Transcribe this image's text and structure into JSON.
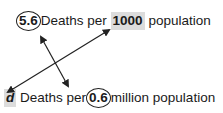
{
  "diagram": {
    "top": {
      "circled_value": "5.6",
      "text_before": "Deaths per ",
      "shaded_value": "1000",
      "text_after": " population"
    },
    "bottom": {
      "shaded_value": "d",
      "text_before": " Deaths per",
      "circled_value": "0.6",
      "text_after": "million population"
    },
    "colors": {
      "shade": "#dcdcdc",
      "stroke": "#222222"
    }
  }
}
